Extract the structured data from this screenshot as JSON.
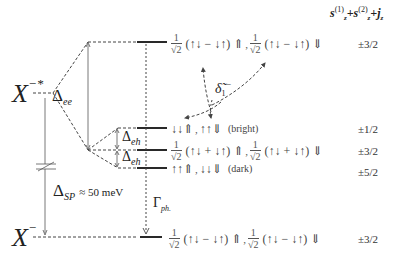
{
  "diagram": {
    "type": "energy-level diagram",
    "column_header": {
      "text": "s_z^(1) + s_z^(2) + j_z",
      "s1": "s",
      "s1_sup": "(1)",
      "s1_sub": "z",
      "plus1": "+",
      "s2": "s",
      "s2_sup": "(2)",
      "s2_sub": "z",
      "plus2": "+",
      "j": "j",
      "j_sub": "z"
    },
    "left_states": {
      "excited": {
        "base": "X",
        "sup": "−*"
      },
      "ground": {
        "base": "X",
        "sup": "−"
      }
    },
    "energy_gaps": {
      "delta_ee": {
        "symbol": "Δ",
        "sub": "ee"
      },
      "delta_eh_1": {
        "symbol": "Δ",
        "sub": "eh"
      },
      "delta_eh_2": {
        "symbol": "Δ",
        "sub": "eh"
      },
      "delta_sp": {
        "symbol": "Δ",
        "sub": "SP",
        "value": "≈ 50 meV"
      }
    },
    "transitions": {
      "relaxation": {
        "symbol": "δ̃",
        "sub": "1",
        "sup": "−"
      },
      "phonon": {
        "symbol": "Γ",
        "sub": "ph."
      }
    },
    "levels": [
      {
        "id": "top",
        "state_a": {
          "frac_num": "1",
          "frac_den": "√2",
          "spins": "(↑↓ − ↓↑) ⇑"
        },
        "sep": ",",
        "state_b": {
          "frac_num": "1",
          "frac_den": "√2",
          "spins": "(↑↓ − ↓↑) ⇓"
        },
        "mj": "±3/2"
      },
      {
        "id": "bright",
        "state_a": {
          "spins": "↓↓⇑"
        },
        "sep": ",",
        "state_b": {
          "spins": "↑↑⇓"
        },
        "tag": "(bright)",
        "mj": "±1/2"
      },
      {
        "id": "middle",
        "state_a": {
          "frac_num": "1",
          "frac_den": "√2",
          "spins": "(↑↓ + ↓↑) ⇑"
        },
        "sep": ",",
        "state_b": {
          "frac_num": "1",
          "frac_den": "√2",
          "spins": "(↑↓ + ↓↑) ⇓"
        },
        "mj": "±3/2"
      },
      {
        "id": "dark",
        "state_a": {
          "spins": "↑↑⇑"
        },
        "sep": ",",
        "state_b": {
          "spins": "↓↓⇓"
        },
        "tag": "(dark)",
        "mj": "±5/2"
      },
      {
        "id": "ground",
        "state_a": {
          "frac_num": "1",
          "frac_den": "√2",
          "spins": "(↑↓ − ↓↑) ⇑"
        },
        "sep": ",",
        "state_b": {
          "frac_num": "1",
          "frac_den": "√2",
          "spins": "(↑↓ − ↓↑) ⇓"
        },
        "mj": "±3/2"
      }
    ]
  }
}
